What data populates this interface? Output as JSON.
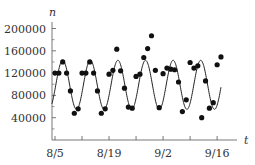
{
  "chart_data": {
    "type": "scatter",
    "title": "",
    "xlabel": "t",
    "ylabel": "n",
    "x_tick_labels": [
      "8/5",
      "8/19",
      "9/2",
      "9/16"
    ],
    "x_tick_days": [
      0,
      14,
      28,
      42
    ],
    "x_minor_tick_days": [
      7,
      21,
      35
    ],
    "y_ticks": [
      40000,
      80000,
      120000,
      160000,
      200000
    ],
    "y_tick_labels": [
      "40000",
      "80000",
      "120000",
      "160000",
      "200000"
    ],
    "y_minor_ticks": [
      20000,
      60000,
      100000,
      140000,
      180000
    ],
    "ylim": [
      0,
      210000
    ],
    "xlim_days": [
      -1,
      47
    ],
    "grid": false,
    "legend": null,
    "series": [
      {
        "name": "observed",
        "kind": "scatter",
        "x_days": [
          0,
          1,
          2,
          3,
          4,
          5,
          6,
          7,
          8,
          9,
          10,
          11,
          12,
          13,
          14,
          15,
          16,
          17,
          18,
          19,
          20,
          21,
          22,
          23,
          24,
          25,
          26,
          27,
          28,
          29,
          30,
          31,
          32,
          33,
          34,
          35,
          36,
          37,
          38,
          39,
          40,
          41,
          42,
          43
        ],
        "values": [
          120000,
          120000,
          140000,
          120000,
          88000,
          48000,
          56000,
          120000,
          120000,
          140000,
          120000,
          88000,
          48000,
          56000,
          118000,
          125000,
          163000,
          124000,
          93000,
          59000,
          57000,
          114000,
          118000,
          148000,
          164000,
          187000,
          125000,
          58000,
          119000,
          129000,
          127000,
          126000,
          104000,
          51000,
          72000,
          139000,
          129000,
          133000,
          40000,
          106000,
          57000,
          67000,
          135000,
          149000
        ]
      },
      {
        "name": "sinusoidal model",
        "kind": "line",
        "mean": 99000,
        "amplitude": 44000,
        "period_days": 7.15,
        "peak_day": 2,
        "x_range_days": [
          -0.8,
          43
        ]
      }
    ]
  },
  "colors": {
    "axis": "#555555",
    "points": "#111111",
    "curve": "#222222",
    "text": "#333333"
  }
}
